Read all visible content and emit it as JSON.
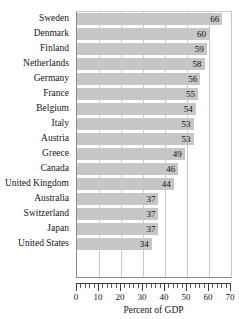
{
  "chart_data": {
    "type": "bar",
    "orientation": "horizontal",
    "title": "",
    "xlabel": "Percent of GDP",
    "ylabel": "",
    "xlim": [
      0,
      70
    ],
    "xticks": [
      0,
      10,
      20,
      30,
      40,
      50,
      60,
      70
    ],
    "minor_tick_interval": 2,
    "grid": "vertical",
    "legend": "none",
    "bar_color": "#c6c6c6",
    "categories": [
      "Sweden",
      "Denmark",
      "Finland",
      "Netherlands",
      "Germany",
      "France",
      "Belgium",
      "Italy",
      "Austria",
      "Greece",
      "Canada",
      "United Kingdom",
      "Australia",
      "Switzerland",
      "Japan",
      "United States"
    ],
    "values": [
      66,
      60,
      59,
      58,
      56,
      55,
      54,
      53,
      53,
      49,
      46,
      44,
      37,
      37,
      37,
      34
    ],
    "value_labels": [
      "66",
      "60",
      "59",
      "58",
      "56",
      "55",
      "54",
      "53",
      "53",
      "49",
      "46",
      "44",
      "37",
      "37",
      "37",
      "34"
    ],
    "xtick_labels": [
      "0",
      "10",
      "20",
      "30",
      "40",
      "50",
      "60",
      "70"
    ]
  }
}
